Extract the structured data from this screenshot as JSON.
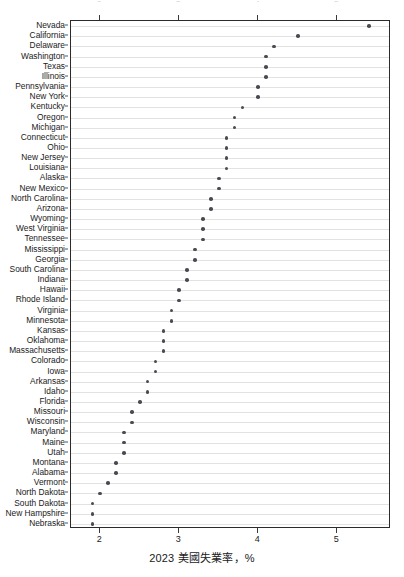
{
  "chart_data": {
    "type": "scatter",
    "title": "",
    "subtitle": "",
    "xlabel": "2023 美國失業率，%",
    "ylabel": "",
    "xlim": [
      1.63,
      5.68
    ],
    "xticks": [
      2,
      3,
      4,
      5
    ],
    "xticklabels": [
      "2",
      "3",
      "4",
      "5"
    ],
    "grid": "horizontal",
    "legend": "none",
    "orientation": "horizontal-dotplot",
    "sort": "descending",
    "categories": [
      "Nevada",
      "California",
      "Delaware",
      "Washington",
      "Texas",
      "Illinois",
      "Pennsylvania",
      "New York",
      "Kentucky",
      "Oregon",
      "Michigan",
      "Connecticut",
      "Ohio",
      "New Jersey",
      "Louisiana",
      "Alaska",
      "New Mexico",
      "North Carolina",
      "Arizona",
      "Wyoming",
      "West Virginia",
      "Tennessee",
      "Mississippi",
      "Georgia",
      "South Carolina",
      "Indiana",
      "Hawaii",
      "Rhode Island",
      "Virginia",
      "Minnesota",
      "Kansas",
      "Oklahoma",
      "Massachusetts",
      "Colorado",
      "Iowa",
      "Arkansas",
      "Idaho",
      "Florida",
      "Missouri",
      "Wisconsin",
      "Maryland",
      "Maine",
      "Utah",
      "Montana",
      "Alabama",
      "Vermont",
      "North Dakota",
      "South Dakota",
      "New Hampshire",
      "Nebraska"
    ],
    "values": [
      5.4,
      4.5,
      4.2,
      4.1,
      4.1,
      4.1,
      4.0,
      4.0,
      3.8,
      3.7,
      3.7,
      3.6,
      3.6,
      3.6,
      3.6,
      3.5,
      3.5,
      3.4,
      3.4,
      3.3,
      3.3,
      3.3,
      3.2,
      3.2,
      3.1,
      3.1,
      3.0,
      3.0,
      2.9,
      2.9,
      2.8,
      2.8,
      2.8,
      2.7,
      2.7,
      2.6,
      2.6,
      2.5,
      2.4,
      2.4,
      2.3,
      2.3,
      2.3,
      2.2,
      2.2,
      2.1,
      2.0,
      1.9,
      1.9,
      1.9
    ]
  }
}
